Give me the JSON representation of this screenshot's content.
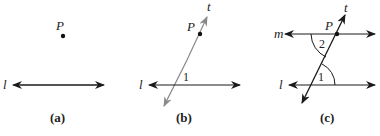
{
  "figures": [
    {
      "id": "a",
      "caption": "(a)",
      "point_label": "P",
      "line_label": "l"
    },
    {
      "id": "b",
      "caption": "(b)",
      "point_label": "P",
      "line_label": "l",
      "transversal_label": "t",
      "angle_label": "1"
    },
    {
      "id": "c",
      "caption": "(c)",
      "point_label": "P",
      "line_label": "l",
      "parallel_line_label": "m",
      "transversal_label": "t",
      "angle_labels": [
        "1",
        "2"
      ]
    }
  ],
  "colors": {
    "line": "#1a1a1a",
    "transversal_b": "#8a8a8a"
  }
}
